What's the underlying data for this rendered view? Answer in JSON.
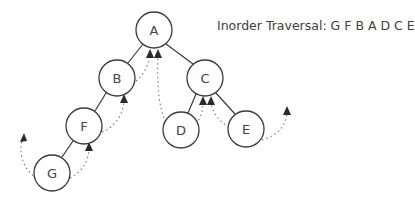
{
  "title": "Inorder Traversal: G F B A D C E",
  "tree": {
    "root": "A",
    "nodes": [
      {
        "id": "A",
        "label": "A",
        "x": 154,
        "y": 30
      },
      {
        "id": "B",
        "label": "B",
        "x": 117,
        "y": 78
      },
      {
        "id": "C",
        "label": "C",
        "x": 205,
        "y": 78
      },
      {
        "id": "F",
        "label": "F",
        "x": 84,
        "y": 126
      },
      {
        "id": "D",
        "label": "D",
        "x": 181,
        "y": 130
      },
      {
        "id": "E",
        "label": "E",
        "x": 246,
        "y": 129
      },
      {
        "id": "G",
        "label": "G",
        "x": 52,
        "y": 173
      }
    ],
    "edges": [
      [
        "A",
        "B"
      ],
      [
        "A",
        "C"
      ],
      [
        "B",
        "F"
      ],
      [
        "F",
        "G"
      ],
      [
        "C",
        "D"
      ],
      [
        "C",
        "E"
      ]
    ]
  },
  "traversal_order": [
    "G",
    "F",
    "B",
    "A",
    "D",
    "C",
    "E"
  ],
  "colors": {
    "stroke": "#3a3a3a",
    "text": "#404040",
    "dotted": "#777777"
  }
}
